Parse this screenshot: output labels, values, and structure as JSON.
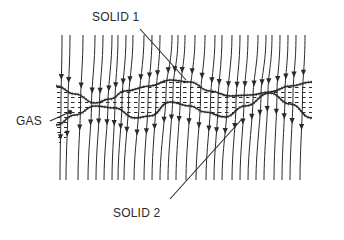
{
  "diagram": {
    "type": "cross-section schematic",
    "labels": {
      "solid1": "SOLID 1",
      "solid2": "SOLID 2",
      "gas": "GAS"
    },
    "label_positions": {
      "solid1": {
        "x": 92,
        "y": 10
      },
      "solid2": {
        "x": 113,
        "y": 206
      },
      "gas": {
        "x": 16,
        "y": 114
      }
    },
    "leaders": {
      "solid1": {
        "from": [
          140,
          29
        ],
        "to": [
          186,
          80
        ]
      },
      "solid2": {
        "from": [
          170,
          199
        ],
        "to": [
          242,
          119
        ]
      },
      "gas": {
        "from": [
          50,
          121
        ],
        "to": [
          70,
          112
        ]
      }
    },
    "colors": {
      "ink": "#2a2a2a",
      "background": "#ffffff"
    },
    "upper_interface": [
      [
        56,
        86
      ],
      [
        75,
        94
      ],
      [
        95,
        103
      ],
      [
        110,
        99
      ],
      [
        125,
        91
      ],
      [
        150,
        86
      ],
      [
        170,
        80
      ],
      [
        190,
        82
      ],
      [
        210,
        91
      ],
      [
        230,
        96
      ],
      [
        250,
        95
      ],
      [
        270,
        92
      ],
      [
        290,
        86
      ],
      [
        312,
        82
      ]
    ],
    "lower_interface": [
      [
        56,
        125
      ],
      [
        75,
        115
      ],
      [
        95,
        106
      ],
      [
        115,
        108
      ],
      [
        135,
        118
      ],
      [
        150,
        116
      ],
      [
        170,
        102
      ],
      [
        190,
        106
      ],
      [
        205,
        112
      ],
      [
        225,
        117
      ],
      [
        245,
        106
      ],
      [
        270,
        93
      ],
      [
        290,
        104
      ],
      [
        312,
        118
      ]
    ],
    "line_top_y": 35,
    "line_bottom_y": 180,
    "field_lines_x_top": [
      62,
      70,
      83,
      95,
      103,
      112,
      118,
      126,
      133,
      144,
      152,
      160,
      172,
      178,
      185,
      195,
      205,
      215,
      222,
      232,
      240,
      248,
      258,
      266,
      272,
      280,
      288,
      296,
      305
    ],
    "field_lines_x_bottom": [
      60,
      66,
      78,
      88,
      96,
      104,
      112,
      118,
      124,
      134,
      144,
      152,
      160,
      168,
      176,
      186,
      196,
      206,
      214,
      222,
      232,
      240,
      248,
      256,
      264,
      274,
      282,
      290,
      300
    ]
  }
}
